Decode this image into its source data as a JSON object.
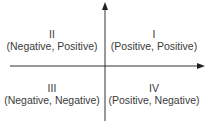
{
  "diagram": {
    "type": "cartesian-quadrants",
    "colors": {
      "axis": "#333333",
      "text": "#3a3a3a",
      "background": "#ffffff"
    },
    "quadrants": {
      "q1": {
        "numeral": "I",
        "signs": "(Positive, Positive)"
      },
      "q2": {
        "numeral": "II",
        "signs": "(Negative, Positive)"
      },
      "q3": {
        "numeral": "III",
        "signs": "(Negative, Negative)"
      },
      "q4": {
        "numeral": "IV",
        "signs": "(Positive, Negative)"
      }
    }
  }
}
